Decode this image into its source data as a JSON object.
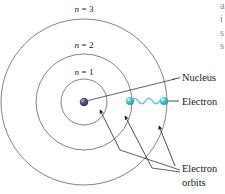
{
  "figure": {
    "shells": [
      {
        "id": "n1",
        "label_n": "n",
        "label_eq": " = ",
        "label_value": "1",
        "label_full": "n = 1",
        "radius": 23
      },
      {
        "id": "n2",
        "label_n": "n",
        "label_eq": " = ",
        "label_value": "2",
        "label_full": "n = 2",
        "radius": 48
      },
      {
        "id": "n3",
        "label_n": "n",
        "label_eq": " = ",
        "label_value": "3",
        "label_full": "n = 3",
        "radius": 83
      }
    ],
    "callouts": {
      "nucleus": "Nucleus",
      "electron": "Electron",
      "electron_orbits_line1": "Electron",
      "electron_orbits_line2": "orbits"
    },
    "colors": {
      "orbit_stroke": "#6b6b6b",
      "nucleus_fill": "#4a4066",
      "nucleus_highlight": "#8b82a8",
      "electron_fill": "#3fb8cc",
      "electron_highlight": "#a9e4ef",
      "wave_stroke": "#66ccdd",
      "leader_stroke": "#3a3a3a",
      "text": "#1a1a1a",
      "edge_text": "#8d8d8d"
    },
    "edge_fragments": [
      "a",
      "i",
      "s",
      "s"
    ]
  }
}
